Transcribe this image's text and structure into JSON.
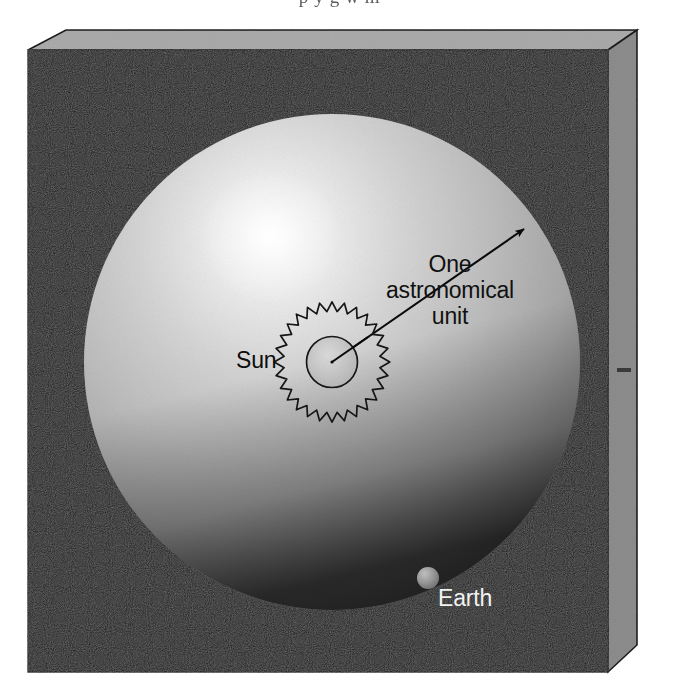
{
  "page": {
    "bleed_text": "p   y         g             w  m"
  },
  "figure": {
    "name": "astronomical-unit-scale-diagram",
    "background_color": "#0d0d0d",
    "box": {
      "front_fill": "#111111",
      "top_fill": "#a9a9a9",
      "side_fill": "#8f8f8f",
      "edge_color": "#000000"
    },
    "orbit_sphere": {
      "name": "orbit-sphere",
      "center_x": 332,
      "center_y": 362,
      "radius": 248,
      "light_color": "#f4f4f4",
      "mid_color": "#a8a8a8",
      "dark_color": "#4a4a4a",
      "highlight_x": 268,
      "highlight_y": 236
    },
    "sun": {
      "name": "sun",
      "label": "Sun",
      "center_x": 332,
      "center_y": 362,
      "inner_radius": 25,
      "corona_radius": 36,
      "spike_count": 29,
      "fill": "#c9c9c9",
      "stroke": "#1a1a1a"
    },
    "earth": {
      "name": "earth",
      "label": "Earth",
      "center_x": 428,
      "center_y": 578,
      "radius": 11,
      "fill": "#9a9a9a"
    },
    "measure_arrow": {
      "name": "one-astronomical-unit-arrow",
      "from_x": 332,
      "from_y": 362,
      "to_x": 526,
      "to_y": 227,
      "color": "#0a0a0a",
      "stroke_width": 2,
      "arrowhead_at": "outer-end"
    },
    "labels": {
      "au_line_1": "One",
      "au_line_2": "astronomical",
      "au_line_3": "unit",
      "sun": "Sun",
      "earth": "Earth"
    }
  }
}
